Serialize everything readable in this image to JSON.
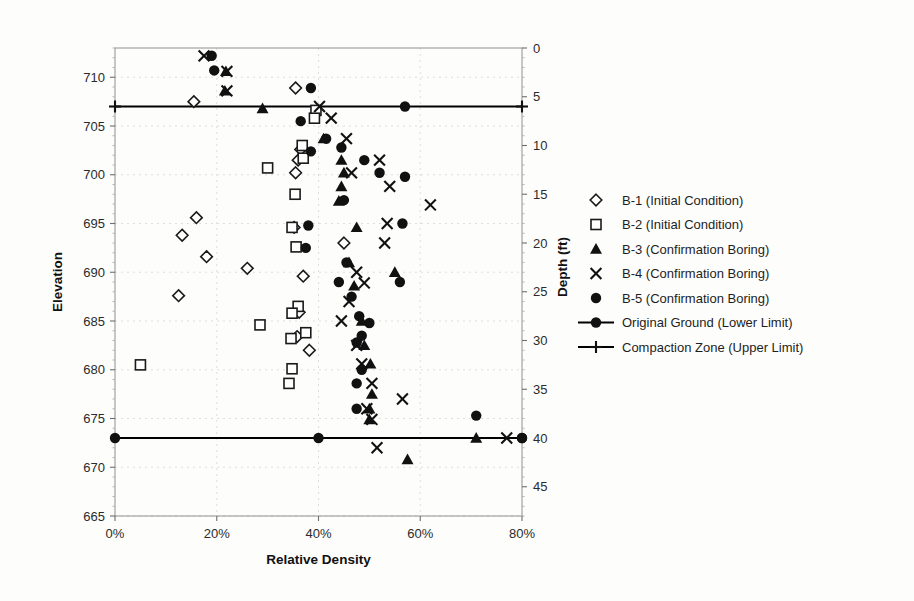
{
  "chart_data": {
    "type": "scatter",
    "title": "",
    "xlabel": "Relative Density",
    "ylabel": "Elevation",
    "y2label": "Depth (ft)",
    "xlim": [
      0,
      80
    ],
    "xticks": [
      "0%",
      "20%",
      "40%",
      "60%",
      "80%"
    ],
    "xtick_values": [
      0,
      20,
      40,
      60,
      80
    ],
    "ylim": [
      665,
      713
    ],
    "yticks": [
      "665",
      "670",
      "675",
      "680",
      "685",
      "690",
      "695",
      "700",
      "705",
      "710"
    ],
    "ytick_values": [
      665,
      670,
      675,
      680,
      685,
      690,
      695,
      700,
      705,
      710
    ],
    "y2ticks": [
      "0",
      "5",
      "10",
      "15",
      "20",
      "25",
      "30",
      "35",
      "40",
      "45"
    ],
    "y2tick_values": [
      0,
      5,
      10,
      15,
      20,
      25,
      30,
      35,
      40,
      45
    ],
    "grid": true,
    "legend_position": "right",
    "series": [
      {
        "name": "B-1 (Initial Condition)",
        "marker": "diamond-open",
        "points": [
          {
            "x": 15.5,
            "y": 707.5
          },
          {
            "x": 16.0,
            "y": 695.6
          },
          {
            "x": 13.2,
            "y": 693.8
          },
          {
            "x": 18.0,
            "y": 691.6
          },
          {
            "x": 12.5,
            "y": 687.6
          },
          {
            "x": 26.0,
            "y": 690.4
          },
          {
            "x": 35.5,
            "y": 708.9
          },
          {
            "x": 36.5,
            "y": 702.6
          },
          {
            "x": 36.0,
            "y": 701.5
          },
          {
            "x": 35.5,
            "y": 700.2
          },
          {
            "x": 35.2,
            "y": 694.6
          },
          {
            "x": 37.0,
            "y": 689.6
          },
          {
            "x": 36.2,
            "y": 685.9
          },
          {
            "x": 35.8,
            "y": 683.4
          },
          {
            "x": 45.0,
            "y": 693.0
          },
          {
            "x": 38.2,
            "y": 682.0
          }
        ]
      },
      {
        "name": "B-2 (Initial Condition)",
        "marker": "square-open",
        "points": [
          {
            "x": 39.5,
            "y": 706.6
          },
          {
            "x": 39.2,
            "y": 705.8
          },
          {
            "x": 36.8,
            "y": 703.0
          },
          {
            "x": 37.0,
            "y": 701.7
          },
          {
            "x": 30.0,
            "y": 700.7
          },
          {
            "x": 35.4,
            "y": 698.0
          },
          {
            "x": 34.8,
            "y": 694.6
          },
          {
            "x": 35.6,
            "y": 692.6
          },
          {
            "x": 36.0,
            "y": 686.5
          },
          {
            "x": 34.8,
            "y": 685.8
          },
          {
            "x": 34.6,
            "y": 683.2
          },
          {
            "x": 28.5,
            "y": 684.6
          },
          {
            "x": 34.8,
            "y": 680.1
          },
          {
            "x": 34.2,
            "y": 678.6
          },
          {
            "x": 5.0,
            "y": 680.5
          },
          {
            "x": 37.5,
            "y": 683.8
          }
        ]
      },
      {
        "name": "B-3 (Confirmation Boring)",
        "marker": "triangle-fill",
        "points": [
          {
            "x": 21.8,
            "y": 710.6
          },
          {
            "x": 21.6,
            "y": 708.6
          },
          {
            "x": 29.0,
            "y": 706.8
          },
          {
            "x": 41.0,
            "y": 703.7
          },
          {
            "x": 44.5,
            "y": 701.5
          },
          {
            "x": 45.0,
            "y": 700.2
          },
          {
            "x": 44.5,
            "y": 698.8
          },
          {
            "x": 44.0,
            "y": 697.3
          },
          {
            "x": 47.5,
            "y": 694.6
          },
          {
            "x": 46.0,
            "y": 691.0
          },
          {
            "x": 47.0,
            "y": 688.6
          },
          {
            "x": 55.0,
            "y": 690.0
          },
          {
            "x": 48.5,
            "y": 685.0
          },
          {
            "x": 49.0,
            "y": 682.5
          },
          {
            "x": 50.2,
            "y": 680.6
          },
          {
            "x": 50.5,
            "y": 677.5
          },
          {
            "x": 50.0,
            "y": 676.0
          },
          {
            "x": 50.0,
            "y": 674.9
          },
          {
            "x": 71.0,
            "y": 673.0
          },
          {
            "x": 57.5,
            "y": 670.8
          }
        ]
      },
      {
        "name": "B-4 (Confirmation Boring)",
        "marker": "x-cross",
        "points": [
          {
            "x": 17.5,
            "y": 712.2
          },
          {
            "x": 22.0,
            "y": 710.6
          },
          {
            "x": 22.0,
            "y": 708.6
          },
          {
            "x": 40.2,
            "y": 707.0
          },
          {
            "x": 42.5,
            "y": 705.8
          },
          {
            "x": 45.5,
            "y": 703.7
          },
          {
            "x": 52.0,
            "y": 701.5
          },
          {
            "x": 46.5,
            "y": 700.2
          },
          {
            "x": 54.0,
            "y": 698.8
          },
          {
            "x": 62.0,
            "y": 696.9
          },
          {
            "x": 53.5,
            "y": 695.0
          },
          {
            "x": 53.0,
            "y": 693.0
          },
          {
            "x": 47.5,
            "y": 690.0
          },
          {
            "x": 49.0,
            "y": 688.9
          },
          {
            "x": 46.0,
            "y": 687.0
          },
          {
            "x": 44.5,
            "y": 685.0
          },
          {
            "x": 47.5,
            "y": 682.5
          },
          {
            "x": 48.5,
            "y": 680.6
          },
          {
            "x": 50.5,
            "y": 678.6
          },
          {
            "x": 49.5,
            "y": 676.0
          },
          {
            "x": 56.5,
            "y": 677.0
          },
          {
            "x": 50.5,
            "y": 674.9
          },
          {
            "x": 51.5,
            "y": 672.0
          },
          {
            "x": 77.0,
            "y": 673.0
          }
        ]
      },
      {
        "name": "B-5 (Confirmation Boring)",
        "marker": "circle-fill",
        "points": [
          {
            "x": 19.0,
            "y": 712.2
          },
          {
            "x": 19.5,
            "y": 710.7
          },
          {
            "x": 38.5,
            "y": 708.9
          },
          {
            "x": 36.5,
            "y": 705.5
          },
          {
            "x": 41.5,
            "y": 703.7
          },
          {
            "x": 38.5,
            "y": 702.4
          },
          {
            "x": 44.5,
            "y": 702.8
          },
          {
            "x": 57.0,
            "y": 707.0
          },
          {
            "x": 49.0,
            "y": 701.5
          },
          {
            "x": 52.0,
            "y": 700.2
          },
          {
            "x": 45.0,
            "y": 697.4
          },
          {
            "x": 57.0,
            "y": 699.8
          },
          {
            "x": 38.0,
            "y": 694.8
          },
          {
            "x": 56.5,
            "y": 695.0
          },
          {
            "x": 37.5,
            "y": 692.5
          },
          {
            "x": 45.5,
            "y": 691.0
          },
          {
            "x": 44.0,
            "y": 689.0
          },
          {
            "x": 56.0,
            "y": 689.0
          },
          {
            "x": 46.5,
            "y": 687.5
          },
          {
            "x": 48.0,
            "y": 685.5
          },
          {
            "x": 48.5,
            "y": 683.5
          },
          {
            "x": 47.5,
            "y": 682.8
          },
          {
            "x": 50.0,
            "y": 684.8
          },
          {
            "x": 48.5,
            "y": 680.0
          },
          {
            "x": 47.5,
            "y": 678.6
          },
          {
            "x": 47.5,
            "y": 676.0
          },
          {
            "x": 71.0,
            "y": 675.3
          },
          {
            "x": 40.0,
            "y": 673.0
          },
          {
            "x": 80.0,
            "y": 673.0
          }
        ]
      }
    ],
    "reference_lines": [
      {
        "name": "Original Ground (Lower Limit)",
        "y": 673.0,
        "marker": "circle-fill"
      },
      {
        "name": "Compaction Zone (Upper Limit)",
        "y": 707.0,
        "marker": "plus-cross"
      }
    ]
  },
  "legend": {
    "items": [
      {
        "label": "B-1 (Initial Condition)",
        "marker": "diamond-open"
      },
      {
        "label": "B-2 (Initial Condition)",
        "marker": "square-open"
      },
      {
        "label": "B-3 (Confirmation Boring)",
        "marker": "triangle-fill"
      },
      {
        "label": "B-4 (Confirmation Boring)",
        "marker": "x-cross"
      },
      {
        "label": "B-5 (Confirmation Boring)",
        "marker": "circle-fill"
      },
      {
        "label": "Original Ground (Lower Limit)",
        "marker": "line-circle"
      },
      {
        "label": "Compaction Zone (Upper Limit)",
        "marker": "line-plus"
      }
    ]
  },
  "colors": {
    "marker": "#111111",
    "frame": "#9a9a9a",
    "grid": "#dedede",
    "limit_line": "#000000",
    "background": "#fdfdfc"
  }
}
